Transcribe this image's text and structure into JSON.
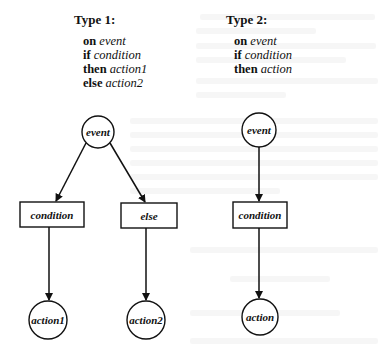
{
  "type1": {
    "title": "Type 1:",
    "rule": [
      {
        "keyword": "on",
        "arg": "event"
      },
      {
        "keyword": "if",
        "arg": "condition"
      },
      {
        "keyword": "then",
        "arg": "action1"
      },
      {
        "keyword": "else",
        "arg": "action2"
      }
    ],
    "nodes": {
      "event": "event",
      "condition": "condition",
      "else": "else",
      "action1": "action1",
      "action2": "action2"
    }
  },
  "type2": {
    "title": "Type 2:",
    "rule": [
      {
        "keyword": "on",
        "arg": "event"
      },
      {
        "keyword": "if",
        "arg": "condition"
      },
      {
        "keyword": "then",
        "arg": "action"
      }
    ],
    "nodes": {
      "event": "event",
      "condition": "condition",
      "action": "action"
    }
  },
  "colors": {
    "stroke": "#111111",
    "background": "#ffffff"
  }
}
